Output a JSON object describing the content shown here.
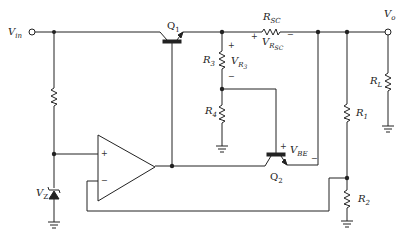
{
  "diagram": {
    "type": "circuit-schematic",
    "labels": {
      "vin": {
        "main": "V",
        "sub": "in"
      },
      "vo": {
        "main": "V",
        "sub": "o"
      },
      "q1": {
        "main": "Q",
        "sub": "1"
      },
      "q2": {
        "main": "Q",
        "sub": "2"
      },
      "rsc": {
        "main": "R",
        "sub": "SC"
      },
      "vrsc": {
        "main": "V",
        "sub": "R",
        "subsub": "SC"
      },
      "r3": {
        "main": "R",
        "sub": "3"
      },
      "vr3": {
        "main": "V",
        "sub": "R",
        "subsub": "3"
      },
      "r4": {
        "main": "R",
        "sub": "4"
      },
      "vbe": {
        "main": "V",
        "sub": "BE"
      },
      "r1": {
        "main": "R",
        "sub": "1"
      },
      "r2": {
        "main": "R",
        "sub": "2"
      },
      "rl": {
        "main": "R",
        "sub": "L"
      },
      "vz": {
        "main": "V",
        "sub": "Z"
      }
    },
    "signs": {
      "plus": "+",
      "minus": "−"
    },
    "components": [
      "Vin terminal",
      "Q1 pass transistor",
      "R_SC sense resistor",
      "R3",
      "R4",
      "Q2 current-limit transistor",
      "op-amp error amplifier",
      "zener diode Vz",
      "bias resistor",
      "R1",
      "R2",
      "R_L load",
      "Vo terminal"
    ],
    "colors": {
      "line": "#222222",
      "background": "#ffffff"
    }
  }
}
